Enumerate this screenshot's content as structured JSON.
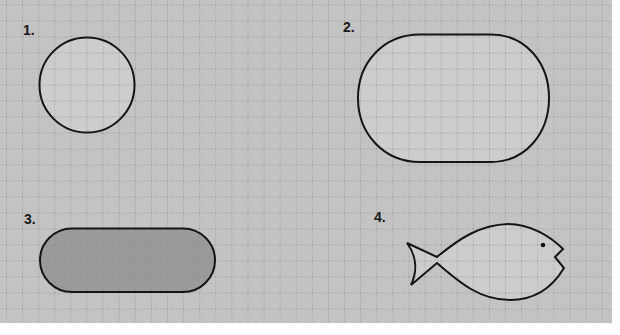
{
  "canvas": {
    "width": 620,
    "height": 335,
    "sheet": {
      "x": 0,
      "y": 0,
      "width": 612,
      "height": 323
    },
    "colors": {
      "page_bg": "#ffffff",
      "sheet_bg": "#c3c3c3",
      "grid_line": "#8c8c8c",
      "shape_fill_light": "#cdcdcd",
      "shape_fill_dark": "#9a9a9a",
      "outline": "#151515"
    },
    "grid": {
      "cell_size": 16.1,
      "offset_x": 6,
      "offset_y": 4.5,
      "style": "dotted"
    }
  },
  "figures": [
    {
      "id": 1,
      "label": "1.",
      "shape": "circle",
      "fill": "light"
    },
    {
      "id": 2,
      "label": "2.",
      "shape": "rounded-oval",
      "fill": "light"
    },
    {
      "id": 3,
      "label": "3.",
      "shape": "stadium",
      "fill": "dark"
    },
    {
      "id": 4,
      "label": "4.",
      "shape": "fish",
      "fill": "light"
    }
  ]
}
